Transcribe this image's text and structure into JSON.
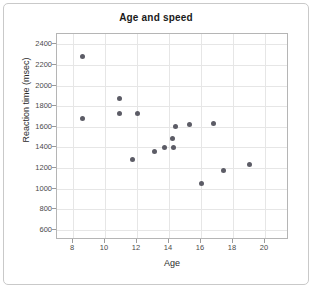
{
  "chart_data": {
    "type": "scatter",
    "title": "Age and speed",
    "xlabel": "Age",
    "ylabel": "Reaction time (msec)",
    "xlim": [
      7.0,
      21.5
    ],
    "ylim": [
      500,
      2500
    ],
    "xticks": [
      8,
      10,
      12,
      14,
      16,
      18,
      20
    ],
    "yticks": [
      600,
      800,
      1000,
      1200,
      1400,
      1600,
      1800,
      2000,
      2200,
      2400
    ],
    "grid": true,
    "legend": null,
    "marker_color": "#5c5c66",
    "points": [
      {
        "x": 8.6,
        "y": 2280
      },
      {
        "x": 8.6,
        "y": 1675
      },
      {
        "x": 10.9,
        "y": 1875
      },
      {
        "x": 10.9,
        "y": 1730
      },
      {
        "x": 12.0,
        "y": 1730
      },
      {
        "x": 11.7,
        "y": 1280
      },
      {
        "x": 13.1,
        "y": 1360
      },
      {
        "x": 13.7,
        "y": 1400
      },
      {
        "x": 14.2,
        "y": 1490
      },
      {
        "x": 14.3,
        "y": 1400
      },
      {
        "x": 14.4,
        "y": 1605
      },
      {
        "x": 15.3,
        "y": 1620
      },
      {
        "x": 16.0,
        "y": 1045
      },
      {
        "x": 16.8,
        "y": 1635
      },
      {
        "x": 17.4,
        "y": 1175
      },
      {
        "x": 19.0,
        "y": 1230
      }
    ]
  },
  "colors": {
    "marker": "#5c5c66",
    "grid": "#e6e6e6",
    "frame": "#b5b5b5",
    "card_border": "#c9c9c9",
    "text": "#2b2b2b"
  }
}
